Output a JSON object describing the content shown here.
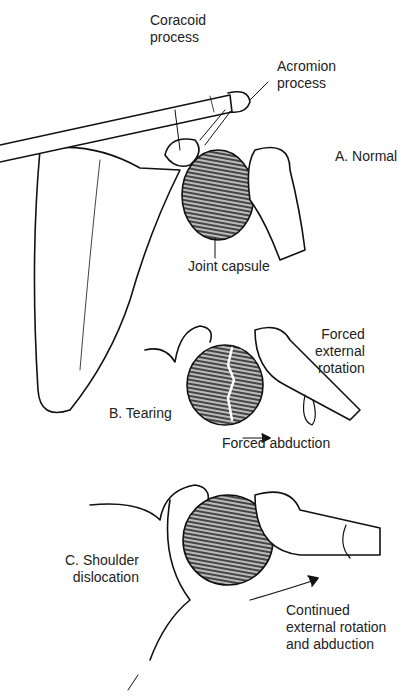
{
  "figure": {
    "panels": [
      {
        "id": "A",
        "title": "A. Normal"
      },
      {
        "id": "B",
        "title": "B. Tearing"
      },
      {
        "id": "C",
        "title": "C. Shoulder\ndislocation"
      }
    ],
    "labels": {
      "coracoid": "Coracoid\nprocess",
      "acromion": "Acromion\nprocess",
      "joint_capsule": "Joint capsule",
      "forced_external_rotation": "Forced\nexternal\nrotation",
      "forced_abduction": "Forced abduction",
      "continued": "Continued\nexternal rotation\nand abduction"
    }
  }
}
